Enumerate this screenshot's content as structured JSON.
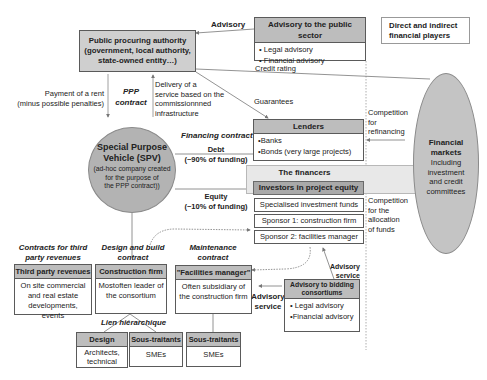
{
  "public_authority": {
    "title": "Public procuring authority",
    "line2": "(government, local authority,",
    "line3": "state-owned entity…)"
  },
  "advisory_public": {
    "label": "Advisory",
    "title": "Advisory to the public sector",
    "items": [
      "• Legal advisory",
      "• Financial advisory"
    ]
  },
  "financial_players_box": {
    "line1": "Direct and indirect",
    "line2": "financial players"
  },
  "edges": {
    "payment_line1": "Payment of a rent",
    "payment_line2": "(minus possible penalties)",
    "ppp_line1": "PPP",
    "ppp_line2": "contract",
    "delivery_line1": "Delivery of a",
    "delivery_line2": "service based on the",
    "delivery_line3": "commissionnned",
    "delivery_line4": "infrastructure",
    "credit_rating": "Credit rating",
    "guarantees": "Guarantees",
    "financing_contract": "Financing contract",
    "debt_line1": "Debt",
    "debt_line2": "(~90% of funding)",
    "equity_line1": "Equity",
    "equity_line2": "(~10% of funding)",
    "competition_refi_line1": "Competition",
    "competition_refi_line2": "for",
    "competition_refi_line3": "refinancing",
    "competition_alloc_line1": "Competition",
    "competition_alloc_line2": "for the",
    "competition_alloc_line3": "allocation",
    "competition_alloc_line4": "of funds",
    "third_party_contracts_line1": "Contracts for third",
    "third_party_contracts_line2": "party revenues",
    "design_build_line1": "Design and build",
    "design_build_line2": "contract",
    "maintenance_line1": "Maintenance",
    "maintenance_line2": "contract",
    "lien": "Lien hiérarchique",
    "advisory_service_a_line1": "Advisory",
    "advisory_service_a_line2": "service",
    "advisory_service_b_line1": "Advisory",
    "advisory_service_b_line2": "service"
  },
  "spv": {
    "title_line1": "Special Purpose",
    "title_line2": "Vehicle (SPV)",
    "sub_line1": "(ad-hoc company created",
    "sub_line2": "for the purpose of",
    "sub_line3": "the PPP contract))"
  },
  "lenders": {
    "title": "Lenders",
    "items": [
      "•Banks",
      "•Bonds (very large projects)"
    ]
  },
  "financers": {
    "title": "The financers"
  },
  "investors": {
    "title": "Investors in project equity",
    "items": [
      "Specialised investment funds",
      "Sponsor 1: construction firm",
      "Sponsor 2: facilities manager"
    ]
  },
  "financial_markets": {
    "title_line1": "Financial",
    "title_line2": "markets",
    "sub_line1": "Including",
    "sub_line2": "investment",
    "sub_line3": "and credit",
    "sub_line4": "committees"
  },
  "third_party": {
    "title": "Third party revenues",
    "line1": "On site commercial",
    "line2": "and real estate",
    "line3": "developments, events"
  },
  "construction": {
    "title": "Construction firm",
    "line1": "Mostoften leader of",
    "line2": "the consortium"
  },
  "facilities": {
    "title": "\"Facilities manager\"",
    "line1": "Often subsidiary of",
    "line2": "the construction firm"
  },
  "advisory_bidding": {
    "title_line1": "Advisory to bidding",
    "title_line2": "consortiums",
    "items": [
      "• Legal advisory",
      "•Financial advisory"
    ]
  },
  "design": {
    "title": "Design",
    "line1": "Architects,",
    "line2": "technical"
  },
  "sous_traitants_1": {
    "title": "Sous-traitants",
    "line1": "SMEs"
  },
  "sous_traitants_2": {
    "title": "Sous-traitants",
    "line1": "SMEs"
  },
  "colors": {
    "header_gray": "#bdbdbd",
    "circle_gray": "#b3b3b3",
    "band_gray": "#e6e6e6",
    "line_gray": "#6b6b6b"
  }
}
